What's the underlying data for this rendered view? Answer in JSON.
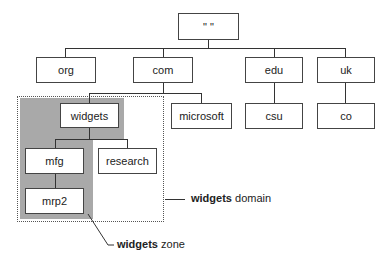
{
  "diagram": {
    "type": "tree",
    "root": {
      "id": "root",
      "label": "\" \""
    },
    "level1": [
      {
        "id": "org",
        "label": "org"
      },
      {
        "id": "com",
        "label": "com"
      },
      {
        "id": "edu",
        "label": "edu"
      },
      {
        "id": "uk",
        "label": "uk"
      }
    ],
    "level2": [
      {
        "id": "widgets",
        "label": "widgets",
        "parent": "com"
      },
      {
        "id": "microsoft",
        "label": "microsoft",
        "parent": "com"
      },
      {
        "id": "csu",
        "label": "csu",
        "parent": "edu"
      },
      {
        "id": "co",
        "label": "co",
        "parent": "uk"
      }
    ],
    "level3": [
      {
        "id": "mfg",
        "label": "mfg",
        "parent": "widgets"
      },
      {
        "id": "research",
        "label": "research",
        "parent": "widgets"
      }
    ],
    "level4": [
      {
        "id": "mrp2",
        "label": "mrp2",
        "parent": "mfg"
      }
    ],
    "annotations": {
      "domain": {
        "bold": "widgets",
        "rest": " domain"
      },
      "zone": {
        "bold": "widgets",
        "rest": " zone"
      }
    },
    "colors": {
      "zone_fill": "#a9a9a9",
      "line": "#333333",
      "box_border": "#444444"
    }
  }
}
